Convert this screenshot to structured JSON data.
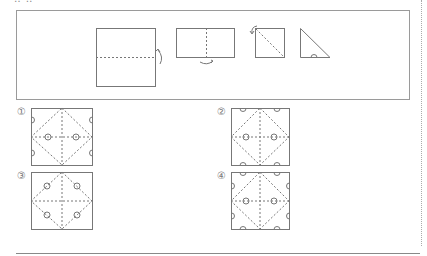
{
  "header": {
    "partial_text": "‥ ‥"
  },
  "folding_steps": [
    {
      "step": 1,
      "shape": "square",
      "fold": "horizontal-dashed",
      "arrow": "right-side fold up"
    },
    {
      "step": 2,
      "shape": "rectangle",
      "fold": "vertical-dashed",
      "arrow": "bottom fold"
    },
    {
      "step": 3,
      "shape": "square",
      "fold": "diagonal-dashed",
      "arrow": "top-left fold"
    },
    {
      "step": 4,
      "shape": "right-triangle",
      "cut": "semicircle at bottom edge"
    }
  ],
  "options": [
    {
      "label": "①"
    },
    {
      "label": "②"
    },
    {
      "label": "③"
    },
    {
      "label": "④"
    }
  ],
  "colors": {
    "line": "#777777",
    "dashed": "#8a8a8a",
    "border": "#9a9a9a"
  }
}
